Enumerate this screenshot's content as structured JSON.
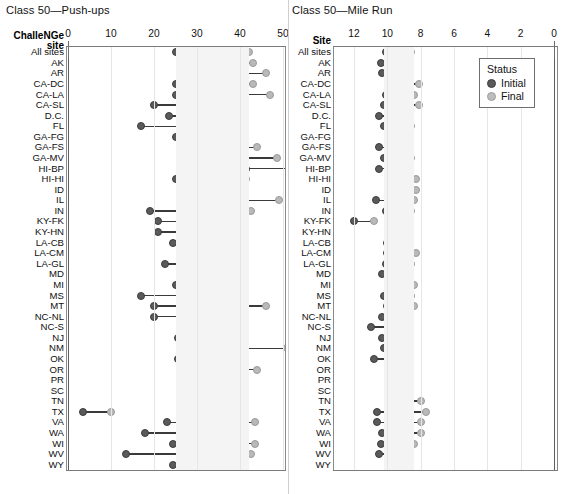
{
  "panels": {
    "left": {
      "title": "Class 50—Push-ups",
      "column_header_line1": "ChalleNGe",
      "column_header_line2": "site"
    },
    "right": {
      "title": "Class 50—Mile Run",
      "column_header_line1": "Site",
      "column_header_line2": ""
    }
  },
  "legend": {
    "title": "Status",
    "items": [
      {
        "label": "Initial",
        "color": "#5a5a5a"
      },
      {
        "label": "Final",
        "color": "#bdbdbd"
      }
    ]
  },
  "colors": {
    "initial": "#5a5a5a",
    "final": "#bdbdbd",
    "connector": "#3a3a3a",
    "band": "#f4f4f4",
    "grid": "#e6e6e6",
    "frame": "#7b7b7b"
  },
  "chart_data": [
    {
      "type": "bar",
      "subtype": "dumbbell",
      "title": "Class 50—Push-ups",
      "xlabel": "",
      "ylabel": "ChalleNGe site",
      "xlim": [
        0,
        55
      ],
      "reversed": false,
      "ticks": [
        0,
        10,
        20,
        30,
        40,
        50
      ],
      "tick_labels": [
        "0",
        "10",
        "20",
        "30",
        "40",
        "50"
      ],
      "grid": true,
      "reference_band": [
        25,
        42
      ],
      "legend_position": "top-right",
      "series": [
        {
          "name": "Initial",
          "color": "#5a5a5a"
        },
        {
          "name": "Final",
          "color": "#bdbdbd"
        }
      ],
      "categories": [
        "All sites",
        "AK",
        "AR",
        "CA-DC",
        "CA-LA",
        "CA-SL",
        "D.C.",
        "FL",
        "GA-FG",
        "GA-FS",
        "GA-MV",
        "HI-BP",
        "HI-HI",
        "ID",
        "IL",
        "IN",
        "KY-FK",
        "KY-HN",
        "LA-CB",
        "LA-CM",
        "LA-GL",
        "MD",
        "MI",
        "MS",
        "MT",
        "NC-NL",
        "NC-S",
        "NJ",
        "NM",
        "OK",
        "OR",
        "PR",
        "SC",
        "TN",
        "TX",
        "VA",
        "WA",
        "WI",
        "WV",
        "WY"
      ],
      "initial": [
        25.0,
        26.0,
        31.0,
        25.0,
        25.0,
        20.0,
        23.5,
        17.0,
        25.0,
        29.0,
        35.5,
        41.5,
        25.0,
        29.5,
        26.0,
        19.0,
        21.0,
        21.0,
        24.5,
        26.5,
        22.5,
        29.0,
        25.0,
        17.0,
        20.0,
        20.0,
        27.0,
        25.5,
        33.0,
        25.5,
        31.0,
        26.0,
        27.0,
        27.0,
        3.5,
        23.0,
        18.0,
        24.5,
        13.5,
        24.5
      ],
      "final": [
        42.0,
        43.0,
        46.0,
        43.0,
        47.0,
        38.0,
        41.0,
        33.5,
        39.0,
        44.0,
        48.5,
        52.0,
        41.5,
        36.5,
        49.0,
        42.5,
        38.0,
        33.0,
        33.0,
        40.0,
        31.0,
        31.0,
        37.5,
        40.0,
        46.0,
        39.5,
        35.0,
        35.0,
        51.0,
        41.0,
        44.0,
        37.0,
        38.5,
        41.0,
        10.0,
        43.5,
        28.0,
        43.5,
        42.5,
        35.0
      ]
    },
    {
      "type": "bar",
      "subtype": "dumbbell",
      "title": "Class 50—Mile Run",
      "xlabel": "",
      "ylabel": "Site",
      "xlim": [
        14,
        0
      ],
      "reversed": true,
      "ticks": [
        12,
        10,
        8,
        6,
        4,
        2,
        0
      ],
      "tick_labels": [
        "12",
        "10",
        "8",
        "6",
        "4",
        "2",
        "0"
      ],
      "grid": true,
      "reference_band": [
        10.2,
        8.4
      ],
      "legend_position": "top-right",
      "series": [
        {
          "name": "Initial",
          "color": "#5a5a5a"
        },
        {
          "name": "Final",
          "color": "#bdbdbd"
        }
      ],
      "categories": [
        "All sites",
        "AK",
        "AR",
        "CA-DC",
        "CA-LA",
        "CA-SL",
        "D.C.",
        "FL",
        "GA-FG",
        "GA-FS",
        "GA-MV",
        "HI-BP",
        "HI-HI",
        "ID",
        "IL",
        "IN",
        "KY-FK",
        "KY-HN",
        "LA-CB",
        "LA-CM",
        "LA-GL",
        "MD",
        "MI",
        "MS",
        "MT",
        "NC-NL",
        "NC-S",
        "NJ",
        "NM",
        "OK",
        "OR",
        "PR",
        "SC",
        "TN",
        "TX",
        "VA",
        "WA",
        "WI",
        "WV",
        "WY"
      ],
      "initial": [
        10.1,
        10.4,
        10.3,
        9.3,
        10.1,
        10.2,
        10.5,
        10.2,
        9.9,
        10.5,
        10.2,
        10.5,
        9.9,
        9.7,
        10.7,
        10.1,
        12.0,
        9.9,
        10.0,
        10.0,
        10.1,
        10.3,
        9.4,
        10.2,
        10.0,
        10.3,
        11.0,
        10.3,
        10.2,
        10.8,
        9.8,
        9.4,
        9.9,
        9.9,
        10.6,
        10.6,
        10.3,
        10.4,
        10.5,
        9.8
      ],
      "final": [
        8.6,
        8.8,
        9.4,
        8.1,
        8.4,
        8.1,
        9.5,
        8.6,
        9.6,
        8.7,
        8.6,
        9.8,
        8.3,
        8.3,
        8.4,
        8.6,
        10.8,
        9.6,
        9.5,
        8.3,
        8.6,
        9.4,
        8.4,
        8.6,
        8.4,
        8.7,
        9.7,
        9.5,
        9.4,
        9.1,
        9.7,
        9.0,
        8.9,
        8.0,
        7.7,
        8.0,
        8.0,
        8.4,
        8.7,
        9.3
      ]
    }
  ]
}
